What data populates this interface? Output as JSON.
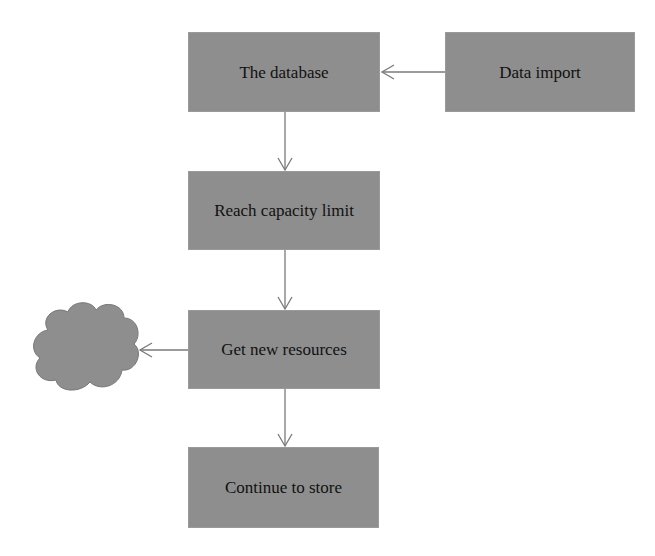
{
  "diagram": {
    "type": "flowchart",
    "nodes": [
      {
        "id": "database",
        "label": "The database"
      },
      {
        "id": "import",
        "label": "Data import"
      },
      {
        "id": "capacity",
        "label": "Reach capacity limit"
      },
      {
        "id": "resources",
        "label": "Get new resources"
      },
      {
        "id": "store",
        "label": "Continue to store"
      },
      {
        "id": "cloud",
        "label": "",
        "shape": "cloud"
      }
    ],
    "edges": [
      {
        "from": "import",
        "to": "database"
      },
      {
        "from": "database",
        "to": "capacity"
      },
      {
        "from": "capacity",
        "to": "resources"
      },
      {
        "from": "resources",
        "to": "cloud"
      },
      {
        "from": "resources",
        "to": "store"
      }
    ],
    "colors": {
      "box_fill": "#8e8e8e",
      "arrow": "#7a7a7a",
      "text": "#111111"
    }
  }
}
